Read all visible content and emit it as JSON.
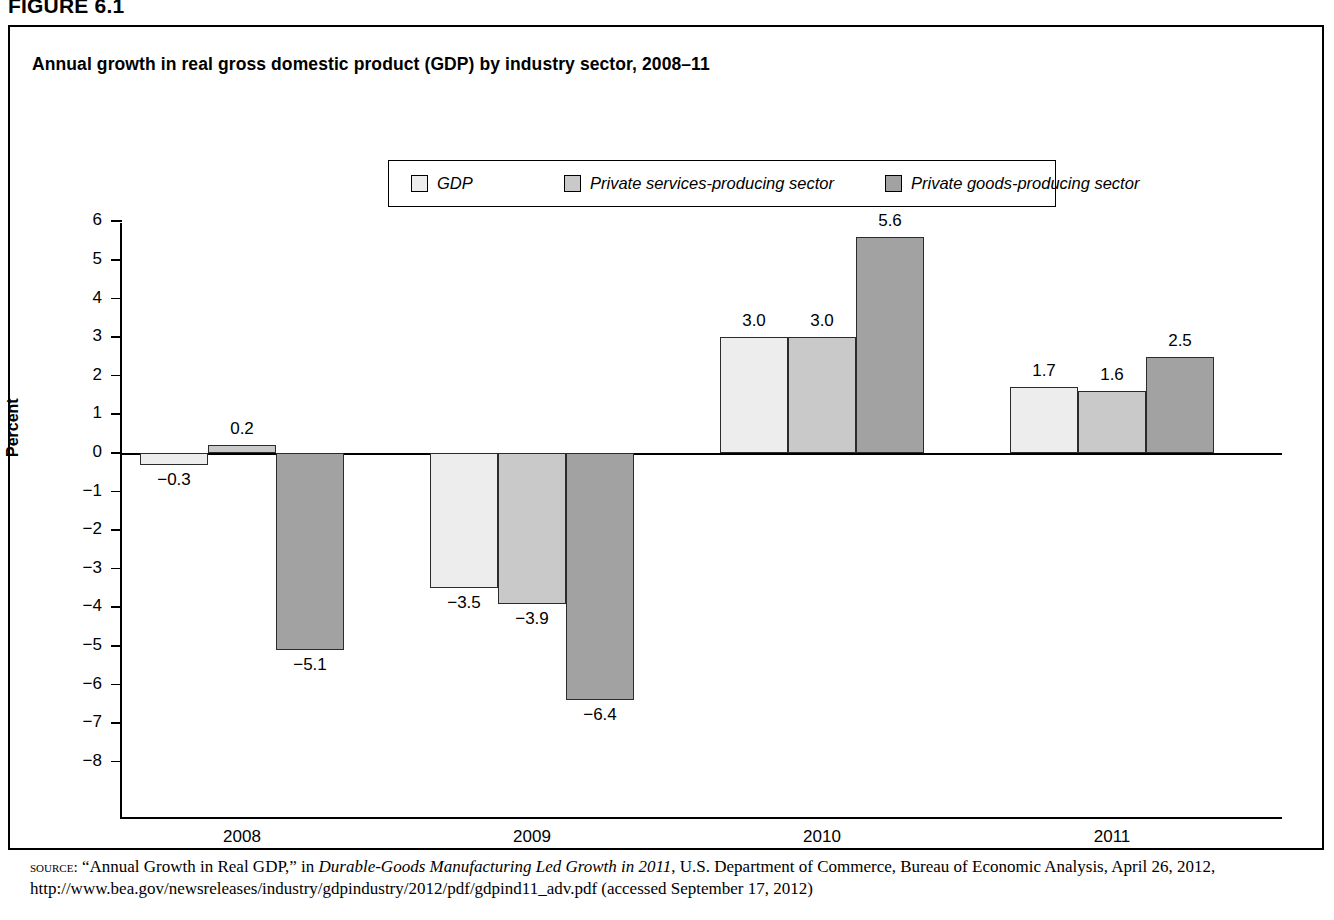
{
  "figure": {
    "label": "FIGURE 6.1",
    "title": "Annual growth in real gross domestic product (GDP) by industry sector, 2008–11"
  },
  "legend": {
    "position": "top-center",
    "entries": [
      {
        "label": "GDP",
        "color": "#ededed"
      },
      {
        "label": "Private services-producing sector",
        "color": "#c9c9c9"
      },
      {
        "label": "Private goods-producing sector",
        "color": "#a2a2a2"
      }
    ]
  },
  "axes": {
    "ylabel": "Percent",
    "yticks": [
      "6",
      "5",
      "4",
      "3",
      "2",
      "1",
      "0",
      "−1",
      "−2",
      "−3",
      "−4",
      "−5",
      "−6",
      "−7",
      "−8"
    ],
    "xticks": [
      "2008",
      "2009",
      "2010",
      "2011"
    ]
  },
  "source": {
    "kicker": "source:",
    "text_1": "“Annual Growth in Real GDP,” in ",
    "italic_1": "Durable-Goods Manufacturing Led Growth in 2011",
    "text_2": ", U.S. Department of Commerce, Bureau of Economic Analysis, April 26, 2012, http://www.bea.gov/newsreleases/industry/gdpindustry/2012/pdf/gdpind11_adv.pdf (accessed September 17, 2012)"
  },
  "chart_data": {
    "type": "bar",
    "title": "Annual growth in real gross domestic product (GDP) by industry sector, 2008–11",
    "xlabel": "",
    "ylabel": "Percent",
    "ylim": [
      -8,
      6
    ],
    "ytick_step": 1,
    "grid": false,
    "legend_position": "top-center",
    "categories": [
      "2008",
      "2009",
      "2010",
      "2011"
    ],
    "series": [
      {
        "name": "GDP",
        "color": "#ededed",
        "values": [
          -0.3,
          -3.5,
          3.0,
          1.7
        ],
        "labels": [
          "−0.3",
          "−3.5",
          "3.0",
          "1.7"
        ]
      },
      {
        "name": "Private services-producing sector",
        "color": "#c9c9c9",
        "values": [
          0.2,
          -3.9,
          3.0,
          1.6
        ],
        "labels": [
          "0.2",
          "−3.9",
          "3.0",
          "1.6"
        ]
      },
      {
        "name": "Private goods-producing sector",
        "color": "#a2a2a2",
        "values": [
          -5.1,
          -6.4,
          5.6,
          2.5
        ],
        "labels": [
          "−5.1",
          "−6.4",
          "5.6",
          "2.5"
        ]
      }
    ]
  }
}
